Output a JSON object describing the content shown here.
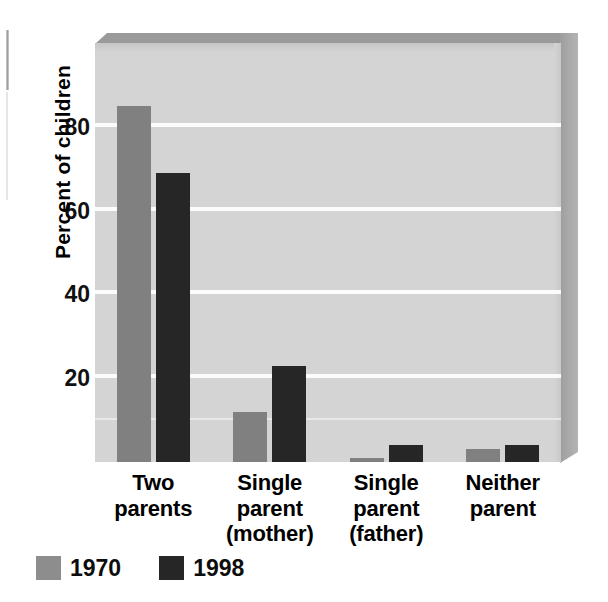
{
  "chart_data": {
    "type": "bar",
    "title": "",
    "subtitle": "",
    "xlabel": "",
    "ylabel": "Percent of children",
    "categories": [
      "Two\nparents",
      "Single\nparent\n(mother)",
      "Single\nparent\n(father)",
      "Neither\nparent"
    ],
    "category_lines": [
      [
        "Two",
        "parents"
      ],
      [
        "Single",
        "parent",
        "(mother)"
      ],
      [
        "Single",
        "parent",
        "(father)"
      ],
      [
        "Neither",
        "parent"
      ]
    ],
    "series": [
      {
        "name": "1970",
        "color": "#808080",
        "values": [
          85,
          12,
          1,
          3
        ]
      },
      {
        "name": "1998",
        "color": "#262626",
        "values": [
          69,
          23,
          4,
          4
        ]
      }
    ],
    "ylim": [
      0,
      100
    ],
    "yticks": [
      20,
      40,
      60,
      80
    ],
    "ytick_labels": [
      "20",
      "40",
      "60",
      "80"
    ],
    "gridlines": [
      10,
      20,
      40,
      60,
      80
    ],
    "grid": true,
    "grid_color": "#fbfbfb",
    "legend_position": "bottom-left",
    "plot_background": "#d4d4d4"
  },
  "legend": {
    "items": [
      {
        "label": "1970",
        "color": "#8d8d8d"
      },
      {
        "label": "1998",
        "color": "#262626"
      }
    ]
  },
  "axis": {
    "y_title": "Percent of children",
    "y_ticks": [
      "80",
      "60",
      "40",
      "20"
    ]
  }
}
